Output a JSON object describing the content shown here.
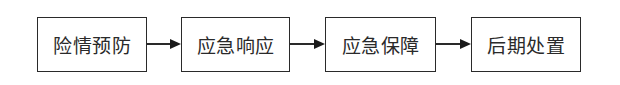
{
  "diagram": {
    "type": "flowchart",
    "direction": "left-to-right",
    "nodes": [
      {
        "id": "n1",
        "label": "险情预防"
      },
      {
        "id": "n2",
        "label": "应急响应"
      },
      {
        "id": "n3",
        "label": "应急保障"
      },
      {
        "id": "n4",
        "label": "后期处置"
      }
    ],
    "edges": [
      {
        "from": "n1",
        "to": "n2"
      },
      {
        "from": "n2",
        "to": "n3"
      },
      {
        "from": "n3",
        "to": "n4"
      }
    ],
    "colors": {
      "stroke": "#2a2a2a",
      "fill": "#ffffff",
      "text": "#2a2a2a"
    }
  }
}
